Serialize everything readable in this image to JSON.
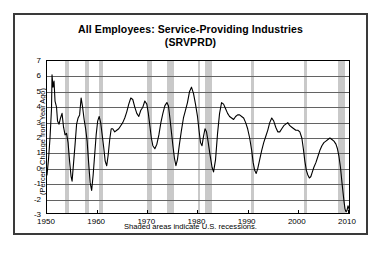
{
  "figure": {
    "title_line1": "All Employees:  Service-Providing Industries",
    "title_line2": "(SRVPRD)",
    "footnote": "Shaded areas indicate U.S. recessions.",
    "ylabel": "(Percent Change from Year Ago)",
    "frame_color": "#3a3a3a",
    "line_color": "#000000",
    "recession_color": "#c9c9c9",
    "grid_color": "#636363",
    "background": "#ffffff"
  },
  "chart_data": {
    "type": "line",
    "title": "All Employees:  Service-Providing Industries (SRVPRD)",
    "xlabel": "",
    "ylabel": "(Percent Change from Year Ago)",
    "xlim": [
      1950,
      2010.6
    ],
    "ylim": [
      -3,
      7
    ],
    "xticks": [
      1950,
      1960,
      1970,
      1980,
      1990,
      2000,
      2010
    ],
    "yticks": [
      -3,
      -2,
      -1,
      0,
      1,
      2,
      3,
      4,
      5,
      6,
      7
    ],
    "grid": true,
    "legend": null,
    "annotations": [
      "Shaded areas indicate U.S. recessions."
    ],
    "recessions": [
      {
        "start": 1953.58,
        "end": 1954.42
      },
      {
        "start": 1957.67,
        "end": 1958.33
      },
      {
        "start": 1960.33,
        "end": 1961.17
      },
      {
        "start": 1969.92,
        "end": 1970.92
      },
      {
        "start": 1973.92,
        "end": 1975.25
      },
      {
        "start": 1980.08,
        "end": 1980.58
      },
      {
        "start": 1981.58,
        "end": 1982.92
      },
      {
        "start": 1990.58,
        "end": 1991.25
      },
      {
        "start": 2001.25,
        "end": 2001.92
      },
      {
        "start": 2007.92,
        "end": 2009.5
      }
    ],
    "series": [
      {
        "name": "SRVPRD (Percent Change from Year Ago)",
        "x": [
          1950.0,
          1950.3,
          1950.6,
          1950.9,
          1951.0,
          1951.2,
          1951.4,
          1951.6,
          1951.9,
          1952.1,
          1952.4,
          1952.7,
          1953.0,
          1953.3,
          1953.6,
          1953.9,
          1954.2,
          1954.5,
          1954.8,
          1955.0,
          1955.3,
          1955.6,
          1955.9,
          1956.2,
          1956.5,
          1956.8,
          1957.1,
          1957.4,
          1957.7,
          1958.0,
          1958.3,
          1958.6,
          1958.9,
          1959.2,
          1959.5,
          1959.8,
          1960.1,
          1960.4,
          1960.7,
          1961.0,
          1961.3,
          1961.6,
          1961.9,
          1962.2,
          1962.5,
          1962.8,
          1963.1,
          1963.5,
          1963.9,
          1964.3,
          1964.7,
          1965.1,
          1965.5,
          1965.9,
          1966.3,
          1966.7,
          1967.1,
          1967.5,
          1967.9,
          1968.3,
          1968.7,
          1969.1,
          1969.5,
          1969.9,
          1970.2,
          1970.5,
          1970.8,
          1971.1,
          1971.5,
          1971.9,
          1972.3,
          1972.7,
          1973.1,
          1973.5,
          1973.9,
          1974.2,
          1974.5,
          1974.8,
          1975.1,
          1975.4,
          1975.7,
          1976.0,
          1976.4,
          1976.8,
          1977.2,
          1977.6,
          1978.0,
          1978.4,
          1978.8,
          1979.2,
          1979.6,
          1980.0,
          1980.3,
          1980.6,
          1980.9,
          1981.2,
          1981.5,
          1981.8,
          1982.1,
          1982.5,
          1982.9,
          1983.2,
          1983.6,
          1984.0,
          1984.4,
          1984.8,
          1985.2,
          1985.6,
          1986.0,
          1986.4,
          1986.8,
          1987.2,
          1987.6,
          1988.0,
          1988.4,
          1988.8,
          1989.2,
          1989.6,
          1990.0,
          1990.4,
          1990.8,
          1991.1,
          1991.4,
          1991.7,
          1992.0,
          1992.4,
          1992.8,
          1993.2,
          1993.6,
          1994.0,
          1994.4,
          1994.8,
          1995.2,
          1995.6,
          1996.0,
          1996.4,
          1996.8,
          1997.2,
          1997.6,
          1998.0,
          1998.4,
          1998.8,
          1999.2,
          1999.6,
          2000.0,
          2000.4,
          2000.8,
          2001.1,
          2001.4,
          2001.7,
          2002.0,
          2002.3,
          2002.6,
          2002.9,
          2003.2,
          2003.6,
          2004.0,
          2004.4,
          2004.8,
          2005.2,
          2005.6,
          2006.0,
          2006.4,
          2006.8,
          2007.2,
          2007.6,
          2007.9,
          2008.2,
          2008.5,
          2008.8,
          2009.0,
          2009.2,
          2009.4,
          2009.6,
          2009.8,
          2010.0,
          2010.2,
          2010.4
        ],
        "y": [
          -0.4,
          0.6,
          2.0,
          3.9,
          6.1,
          5.3,
          5.7,
          4.4,
          4.0,
          3.1,
          2.9,
          3.3,
          3.6,
          2.7,
          2.2,
          2.3,
          1.7,
          0.5,
          -0.5,
          -0.8,
          0.4,
          1.6,
          2.9,
          3.3,
          3.5,
          4.6,
          4.0,
          3.2,
          2.6,
          1.8,
          0.4,
          -0.9,
          -1.4,
          -0.4,
          0.9,
          2.2,
          3.1,
          3.4,
          3.0,
          2.2,
          1.4,
          0.5,
          0.2,
          0.9,
          1.9,
          2.6,
          2.6,
          2.4,
          2.5,
          2.6,
          2.8,
          3.0,
          3.3,
          3.7,
          4.2,
          4.6,
          4.5,
          4.0,
          3.6,
          3.4,
          3.8,
          4.0,
          4.4,
          4.2,
          3.6,
          2.8,
          2.0,
          1.5,
          1.3,
          1.6,
          2.2,
          3.0,
          3.6,
          4.1,
          4.3,
          4.1,
          3.3,
          2.4,
          1.5,
          0.7,
          0.2,
          0.6,
          1.6,
          2.5,
          3.3,
          3.8,
          4.3,
          5.0,
          5.3,
          4.9,
          4.2,
          3.4,
          2.5,
          1.7,
          1.5,
          2.1,
          2.6,
          2.4,
          1.8,
          0.9,
          0.1,
          -0.2,
          0.6,
          2.3,
          3.6,
          4.3,
          4.2,
          3.9,
          3.6,
          3.4,
          3.3,
          3.2,
          3.4,
          3.5,
          3.5,
          3.4,
          3.3,
          3.0,
          2.6,
          2.0,
          1.2,
          0.4,
          -0.1,
          -0.3,
          0.0,
          0.6,
          1.2,
          1.7,
          2.1,
          2.5,
          3.0,
          3.3,
          3.1,
          2.7,
          2.4,
          2.4,
          2.6,
          2.8,
          2.9,
          3.0,
          2.8,
          2.7,
          2.6,
          2.5,
          2.5,
          2.4,
          2.0,
          1.3,
          0.5,
          -0.1,
          -0.4,
          -0.6,
          -0.5,
          -0.2,
          0.1,
          0.4,
          0.8,
          1.2,
          1.5,
          1.7,
          1.8,
          1.9,
          2.0,
          1.9,
          1.8,
          1.6,
          1.3,
          0.8,
          0.1,
          -0.9,
          -1.5,
          -2.1,
          -2.6,
          -2.8,
          -2.7,
          -2.4,
          -2.6,
          -2.8
        ]
      }
    ]
  },
  "axis": {
    "ytick_labels": [
      "7",
      "6",
      "5",
      "4",
      "3",
      "2",
      "1",
      "0",
      "-1",
      "-2",
      "-3"
    ],
    "xtick_labels": [
      "1950",
      "1960",
      "1970",
      "1980",
      "1990",
      "2000",
      "2010"
    ]
  }
}
